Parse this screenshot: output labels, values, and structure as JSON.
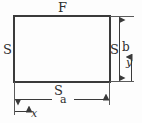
{
  "figure": {
    "background_color": "#fdfdfd",
    "line_color": "#3a3a3a",
    "text_color": "#2e2e2e",
    "labels": {
      "top_boundary": "F",
      "left_boundary": "S",
      "right_boundary": "S",
      "bottom_boundary": "S",
      "height_dimension": "b",
      "width_dimension": "a",
      "axis_x": "x",
      "axis_y": "y"
    },
    "geometry": {
      "rect_left": 14,
      "rect_top": 16,
      "rect_right": 110,
      "rect_bottom": 82,
      "width_px": 96,
      "height_px": 66
    }
  }
}
